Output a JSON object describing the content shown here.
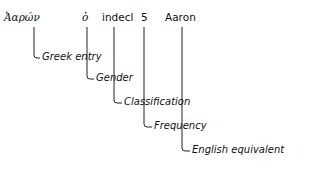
{
  "entry": {
    "greek_word": "Ἀαρών",
    "gender": "ὁ",
    "classification": "indecl",
    "frequency": "5",
    "english": "Aaron"
  },
  "labels": {
    "greek_entry": "Greek entry",
    "gender": "Gender",
    "classification": "Classification",
    "frequency": "Frequency",
    "english_equivalent": "English equivalent"
  }
}
